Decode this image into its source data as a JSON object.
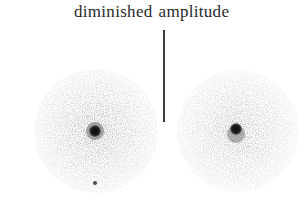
{
  "figure": {
    "caption_word_1": "diminished",
    "caption_word_2": "amplitude",
    "panels": [
      {
        "name": "left-speckle-pattern",
        "center": [
          96,
          131
        ],
        "radius": 62,
        "core_spot": {
          "center": [
            95,
            131
          ],
          "radius": 6
        },
        "stray_dot": {
          "center": [
            95,
            183
          ],
          "radius": 2
        }
      },
      {
        "name": "right-speckle-pattern",
        "center": [
          238,
          131
        ],
        "radius": 61,
        "core_spot": {
          "center": [
            236,
            129
          ],
          "radius": 6
        }
      }
    ],
    "colors": {
      "background": "#ffffff",
      "halo_outer": "#ececec",
      "halo_inner": "#a8a8a8",
      "core": "#151515",
      "text": "#2a2a2a",
      "divider": "#3c3c3c"
    }
  }
}
